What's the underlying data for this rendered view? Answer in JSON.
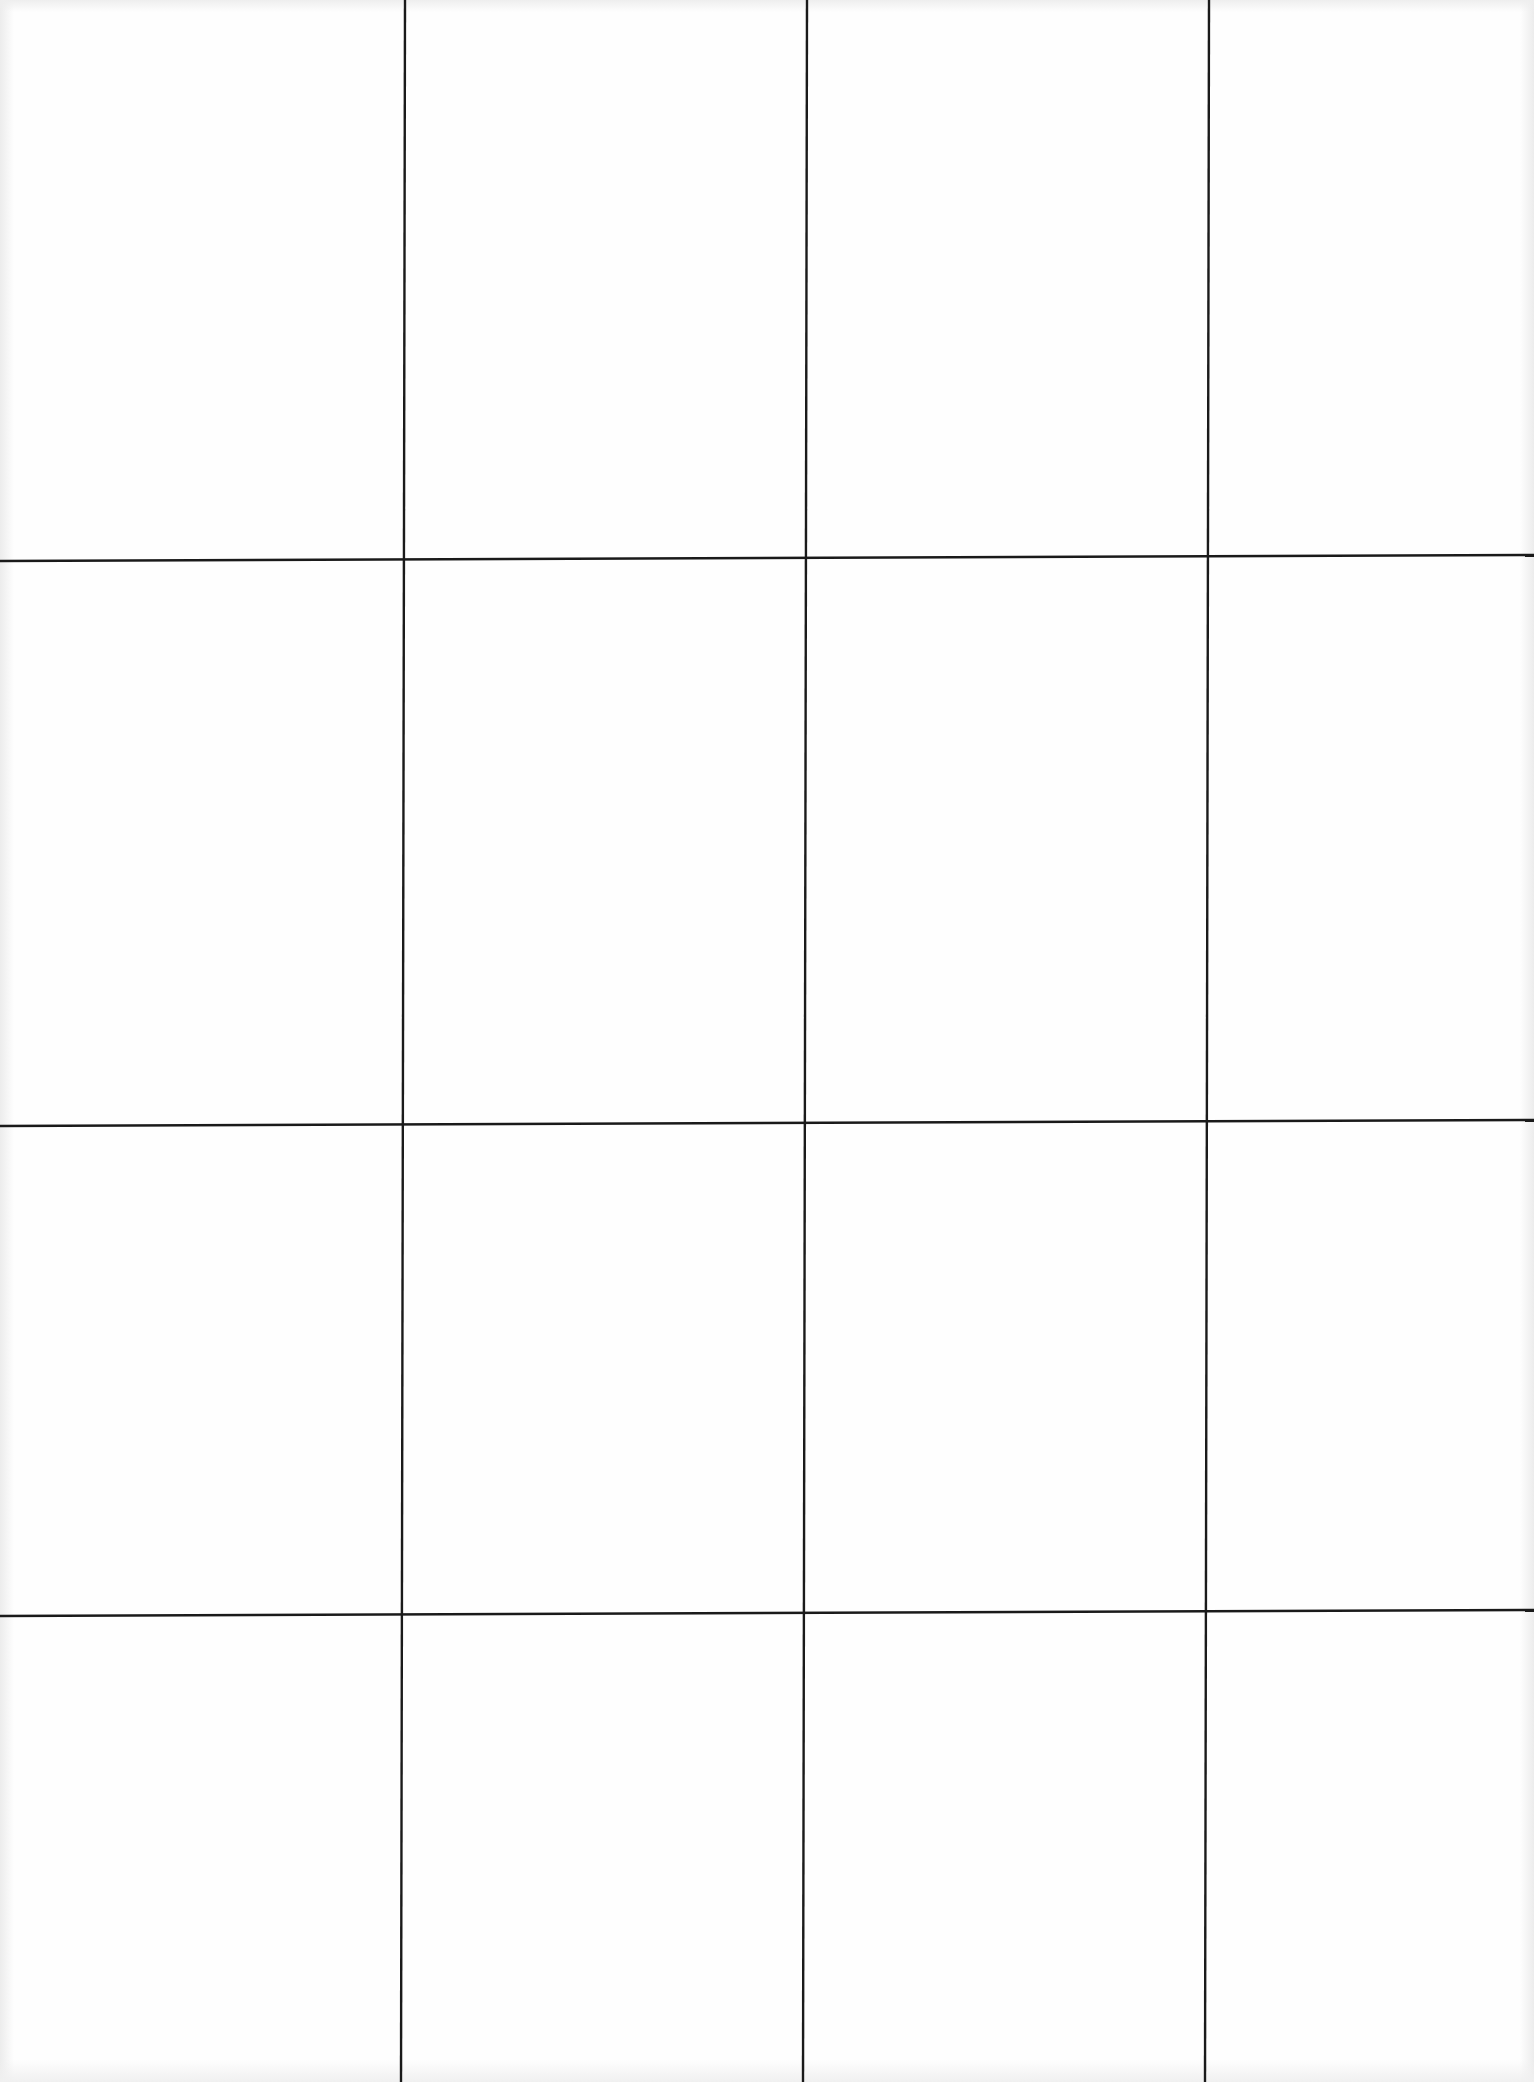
{
  "page": {
    "type": "scanned-blank-grid-sheet",
    "width": 1534,
    "height": 2082,
    "background": "#fefefe",
    "grid": {
      "columns": 4,
      "rows": 4,
      "line_color": "#1a1a1a",
      "line_width": 2.4,
      "vertical_lines": [
        {
          "x1": 405,
          "y1": 0,
          "x2": 401,
          "y2": 2082
        },
        {
          "x1": 807,
          "y1": 0,
          "x2": 803,
          "y2": 2082
        },
        {
          "x1": 1209,
          "y1": 0,
          "x2": 1205,
          "y2": 2082
        }
      ],
      "horizontal_lines": [
        {
          "x1": 0,
          "y1": 561,
          "x2": 1534,
          "y2": 555
        },
        {
          "x1": 0,
          "y1": 1126,
          "x2": 1534,
          "y2": 1120
        },
        {
          "x1": 0,
          "y1": 1616,
          "x2": 1534,
          "y2": 1610
        }
      ]
    },
    "cells": [
      {
        "row": 1,
        "col": 1,
        "content": ""
      },
      {
        "row": 1,
        "col": 2,
        "content": ""
      },
      {
        "row": 1,
        "col": 3,
        "content": ""
      },
      {
        "row": 1,
        "col": 4,
        "content": ""
      },
      {
        "row": 2,
        "col": 1,
        "content": ""
      },
      {
        "row": 2,
        "col": 2,
        "content": ""
      },
      {
        "row": 2,
        "col": 3,
        "content": ""
      },
      {
        "row": 2,
        "col": 4,
        "content": ""
      },
      {
        "row": 3,
        "col": 1,
        "content": ""
      },
      {
        "row": 3,
        "col": 2,
        "content": ""
      },
      {
        "row": 3,
        "col": 3,
        "content": ""
      },
      {
        "row": 3,
        "col": 4,
        "content": ""
      },
      {
        "row": 4,
        "col": 1,
        "content": ""
      },
      {
        "row": 4,
        "col": 2,
        "content": ""
      },
      {
        "row": 4,
        "col": 3,
        "content": ""
      },
      {
        "row": 4,
        "col": 4,
        "content": ""
      }
    ]
  }
}
